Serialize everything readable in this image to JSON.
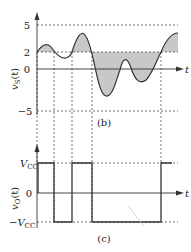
{
  "top_plot": {
    "ylabel": "v",
    "ylabel_sub": "S",
    "ylabel_arg": "(t)",
    "xlabel": "t",
    "ticks": [
      "5",
      "2",
      "0",
      "−5"
    ],
    "caption": "(b)",
    "fill_color": "#c8c8c8",
    "threshold": "2"
  },
  "bottom_plot": {
    "ylabel": "v",
    "ylabel_sub": "O",
    "ylabel_arg": "(t)",
    "xlabel": "t",
    "tick_pos": "V",
    "tick_pos_sub": "CC",
    "tick_zero": "0",
    "tick_neg": "−V",
    "tick_neg_sub": "CC",
    "caption": "(c)"
  }
}
